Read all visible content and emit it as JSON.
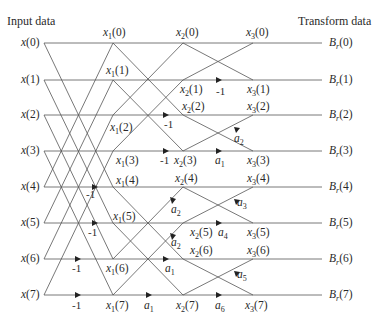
{
  "diagram": {
    "title_left": "Input data",
    "title_right": "Transform data",
    "rows_y": [
      43,
      80,
      115,
      151,
      187,
      223,
      259,
      295
    ],
    "columns_x": {
      "input": 44,
      "stage1": 113,
      "stage2": 183,
      "stage3": 253,
      "output_end": 322
    },
    "inputs": [
      "x(0)",
      "x(1)",
      "x(2)",
      "x(3)",
      "x(4)",
      "x(5)",
      "x(6)",
      "x(7)"
    ],
    "outputs": [
      "B_r(0)",
      "B_r(1)",
      "B_r(2)",
      "B_r(3)",
      "B_r(4)",
      "B_r(5)",
      "B_r(6)",
      "B_r(7)"
    ],
    "stage1_nodes": [
      "x_1(0)",
      "x_1(1)",
      "x_1(2)",
      "x_1(3)",
      "x_1(4)",
      "x_1(5)",
      "x_1(6)",
      "x_1(7)"
    ],
    "stage2_nodes": [
      "x_2(0)",
      "x_2(1)",
      "x_2(2)",
      "x_2(3)",
      "x_2(4)",
      "x_2(5)",
      "x_2(6)",
      "x_2(7)"
    ],
    "stage3_nodes": [
      "x_3(0)",
      "x_3(1)",
      "x_3(2)",
      "x_3(3)",
      "x_3(4)",
      "x_3(5)",
      "x_3(6)",
      "x_3(7)"
    ],
    "stage1_multipliers": {
      "4": "-1",
      "5": "-1",
      "6": "-1",
      "7": "-1"
    },
    "stage2_multipliers": {
      "2": "-1",
      "3": "-1",
      "6": "a_1",
      "7": "a_1"
    },
    "stage2_diag_multipliers": [
      {
        "label": "a_2",
        "target": 4
      },
      {
        "label": "a_2",
        "target": 5
      }
    ],
    "stage3_multipliers": {
      "1": "-1",
      "3": "a_1",
      "5": "a_4",
      "7": "a_6"
    },
    "stage3_diag_multipliers": [
      {
        "label": "a_2",
        "target": 2
      },
      {
        "label": "a_3",
        "target": 4
      },
      {
        "label": "a_5",
        "target": 6
      }
    ]
  }
}
